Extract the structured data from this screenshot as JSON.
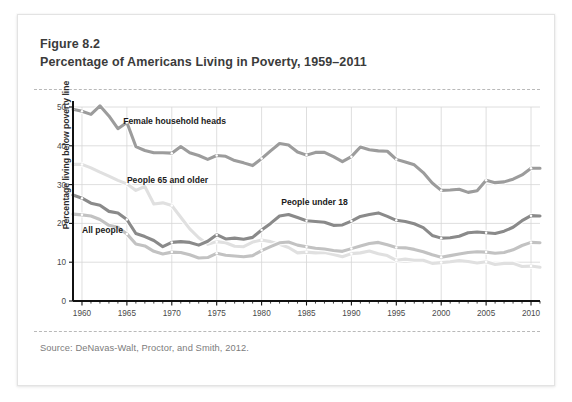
{
  "figure": {
    "label": "Figure 8.2",
    "title": "Percentage of Americans Living in Poverty, 1959–2011",
    "source": "Source: DeNavas-Walt, Proctor, and Smith, 2012."
  },
  "chart_data": {
    "type": "line",
    "title": "Percentage of Americans Living in Poverty, 1959–2011",
    "xlabel": "",
    "ylabel": "Percentage living below poverty line",
    "xlim": [
      1959,
      2011
    ],
    "ylim": [
      0,
      50
    ],
    "yticks": [
      0,
      10,
      20,
      30,
      40,
      50
    ],
    "xticks": [
      1960,
      1965,
      1970,
      1975,
      1980,
      1985,
      1990,
      1995,
      2000,
      2005,
      2010
    ],
    "grid": true,
    "legend_position": "inline-annotations",
    "x": [
      1959,
      1960,
      1961,
      1962,
      1963,
      1964,
      1965,
      1966,
      1967,
      1968,
      1969,
      1970,
      1971,
      1972,
      1973,
      1974,
      1975,
      1976,
      1977,
      1978,
      1979,
      1980,
      1981,
      1982,
      1983,
      1984,
      1985,
      1986,
      1987,
      1988,
      1989,
      1990,
      1991,
      1992,
      1993,
      1994,
      1995,
      1996,
      1997,
      1998,
      1999,
      2000,
      2001,
      2002,
      2003,
      2004,
      2005,
      2006,
      2007,
      2008,
      2009,
      2010,
      2011
    ],
    "series": [
      {
        "name": "Female household heads",
        "label": "Female household heads",
        "color": "#9c9c9c",
        "values": [
          49.4,
          48.9,
          48.1,
          50.3,
          47.7,
          44.4,
          46.0,
          39.8,
          38.8,
          38.2,
          38.2,
          38.1,
          39.8,
          38.2,
          37.5,
          36.5,
          37.5,
          37.3,
          36.2,
          35.6,
          34.9,
          36.7,
          38.7,
          40.6,
          40.2,
          38.4,
          37.6,
          38.3,
          38.3,
          37.2,
          35.9,
          37.2,
          39.7,
          39.0,
          38.7,
          38.6,
          36.5,
          35.8,
          35.1,
          33.1,
          30.4,
          28.5,
          28.6,
          28.8,
          28.0,
          28.4,
          31.1,
          30.5,
          30.7,
          31.4,
          32.5,
          34.2,
          34.2
        ]
      },
      {
        "name": "People 65 and older",
        "label": "People 65 and older",
        "color": "#e0e0e0",
        "values": [
          35.2,
          35.2,
          34.3,
          33.2,
          32.2,
          31.1,
          30.2,
          28.5,
          29.5,
          25.0,
          25.3,
          24.6,
          21.6,
          18.6,
          16.3,
          14.6,
          15.3,
          15.0,
          14.1,
          14.0,
          15.2,
          15.7,
          15.3,
          14.6,
          13.8,
          12.4,
          12.6,
          12.4,
          12.5,
          12.0,
          11.4,
          12.2,
          12.4,
          12.9,
          12.2,
          11.7,
          10.5,
          10.8,
          10.5,
          10.5,
          9.7,
          9.9,
          10.1,
          10.4,
          10.2,
          9.8,
          10.1,
          9.4,
          9.7,
          9.7,
          8.9,
          9.0,
          8.7
        ]
      },
      {
        "name": "People under 18",
        "label": "People under 18",
        "color": "#8a8a8a",
        "values": [
          27.3,
          26.5,
          25.2,
          24.7,
          23.1,
          22.7,
          21.0,
          17.4,
          16.6,
          15.6,
          14.0,
          15.1,
          15.3,
          15.1,
          14.4,
          15.4,
          17.1,
          16.0,
          16.2,
          15.9,
          16.4,
          18.3,
          20.0,
          21.9,
          22.3,
          21.5,
          20.7,
          20.5,
          20.3,
          19.5,
          19.6,
          20.6,
          21.8,
          22.3,
          22.7,
          21.8,
          20.8,
          20.5,
          19.9,
          18.9,
          16.9,
          16.2,
          16.3,
          16.7,
          17.6,
          17.8,
          17.6,
          17.4,
          18.0,
          19.0,
          20.7,
          22.0,
          21.9
        ]
      },
      {
        "name": "All people",
        "label": "All people",
        "color": "#c2c2c2",
        "values": [
          22.4,
          22.2,
          21.9,
          21.0,
          19.5,
          19.0,
          17.3,
          14.7,
          14.2,
          12.8,
          12.1,
          12.6,
          12.5,
          11.9,
          11.1,
          11.2,
          12.3,
          11.8,
          11.6,
          11.4,
          11.7,
          13.0,
          14.0,
          15.0,
          15.2,
          14.4,
          14.0,
          13.6,
          13.4,
          13.0,
          12.8,
          13.5,
          14.2,
          14.8,
          15.1,
          14.5,
          13.8,
          13.7,
          13.3,
          12.7,
          11.9,
          11.3,
          11.7,
          12.1,
          12.5,
          12.7,
          12.6,
          12.3,
          12.5,
          13.2,
          14.3,
          15.1,
          15.0
        ]
      }
    ],
    "annotations": [
      {
        "text": "Female household heads",
        "x": 1964.6,
        "y": 45.6
      },
      {
        "text": "People 65 and older",
        "x": 1965.0,
        "y": 30.4
      },
      {
        "text": "People under 18",
        "x": 1982.2,
        "y": 24.8
      },
      {
        "text": "All people",
        "x": 1960.0,
        "y": 17.6
      }
    ]
  }
}
